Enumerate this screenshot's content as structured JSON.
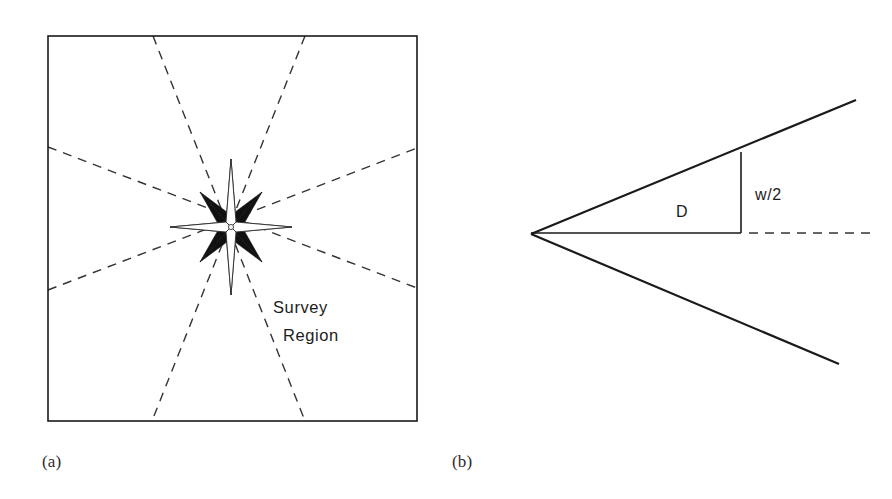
{
  "figure": {
    "panels": [
      {
        "id": "panel-a",
        "caption": "(a)",
        "label": "Survey Region",
        "label_line_1": "Survey",
        "label_line_2": "Region",
        "box": {
          "x": 48,
          "y": 36,
          "width": 369,
          "height": 385
        },
        "center": {
          "x": 231,
          "y": 227
        },
        "line_style": "dashed",
        "beam_lines": [
          {
            "name": "beam-ne-sw",
            "x1": 305,
            "y1": 36,
            "x2": 152,
            "y2": 421
          },
          {
            "name": "beam-nw-se",
            "x1": 153,
            "y1": 36,
            "x2": 305,
            "y2": 421
          },
          {
            "name": "beam-w-e",
            "x1": 48,
            "y1": 290,
            "x2": 417,
            "y2": 148
          },
          {
            "name": "beam-wnw-ese",
            "x1": 48,
            "y1": 147,
            "x2": 417,
            "y2": 288
          }
        ],
        "star": {
          "name": "eight-point-compass-star",
          "points": 8,
          "long_axis_radius": 68,
          "diagonal_radius": 44,
          "light_color": "#ffffff",
          "dark_color": "#111111"
        }
      },
      {
        "id": "panel-b",
        "caption": "(b)",
        "apex": {
          "x": 531,
          "y": 234
        },
        "upper_ray_end": {
          "x": 856,
          "y": 100
        },
        "lower_ray_end": {
          "x": 839,
          "y": 364
        },
        "baseline": {
          "x1": 531,
          "y1": 233,
          "x2": 741,
          "y2": 233
        },
        "dashed_axis": {
          "x1": 749,
          "y1": 233,
          "x2": 876,
          "y2": 233
        },
        "width_marker": {
          "x": 741,
          "y1": 152,
          "y2": 233
        },
        "labels": {
          "distance": "D",
          "half_width": "w/2"
        },
        "label_positions": {
          "distance": {
            "x": 676,
            "y": 217
          },
          "half_width": {
            "x": 755,
            "y": 200
          }
        }
      }
    ]
  },
  "colors": {
    "ink": "#1a1a1a",
    "dashed_ink": "#343434",
    "background": "#ffffff"
  },
  "stroke_widths": {
    "box": 1.6,
    "ray": 2.2,
    "baseline": 1.5,
    "dashed": 1.4
  }
}
